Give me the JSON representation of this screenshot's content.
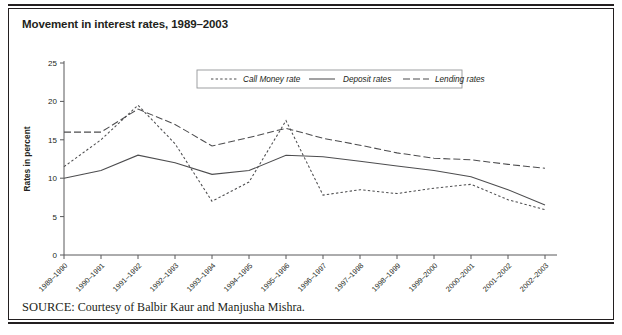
{
  "figure": {
    "title": "Movement in interest rates, 1989–2003",
    "source_label": "SOURCE:",
    "source_text": "Courtesy of Balbir Kaur and Manjusha Mishra."
  },
  "chart_data": {
    "type": "line",
    "title": "Movement in interest rates, 1989–2003",
    "xlabel": "",
    "ylabel": "Rates in percent",
    "ylim": [
      0,
      25
    ],
    "yticks": [
      0,
      5,
      10,
      15,
      20,
      25
    ],
    "grid": false,
    "legend_position": "top-center",
    "categories": [
      "1989–1990",
      "1990–1991",
      "1991–1992",
      "1992–1993",
      "1993–1994",
      "1994–1995",
      "1995–1996",
      "1996–1997",
      "1997–1998",
      "1998–1999",
      "1999–2000",
      "2000–2001",
      "2001–2002",
      "2002–2003"
    ],
    "series": [
      {
        "name": "Call  Money rate",
        "style": "dotted",
        "values": [
          11.5,
          15.0,
          19.5,
          14.5,
          7.0,
          9.5,
          17.5,
          7.8,
          8.5,
          8.0,
          8.7,
          9.2,
          7.2,
          5.9
        ]
      },
      {
        "name": "Deposit rates",
        "style": "solid",
        "values": [
          10.0,
          11.0,
          13.0,
          12.0,
          10.5,
          11.0,
          13.0,
          12.8,
          12.2,
          11.6,
          11.0,
          10.2,
          8.5,
          6.5
        ]
      },
      {
        "name": "Lending rates",
        "style": "dashed",
        "values": [
          16.0,
          16.0,
          19.0,
          17.0,
          14.2,
          15.3,
          16.5,
          15.2,
          14.3,
          13.3,
          12.6,
          12.4,
          11.8,
          11.3
        ]
      }
    ]
  },
  "colors": {
    "ink": "#231f20",
    "axis": "#58595b",
    "series": "#4d4d4f",
    "legend_border": "#939598"
  }
}
